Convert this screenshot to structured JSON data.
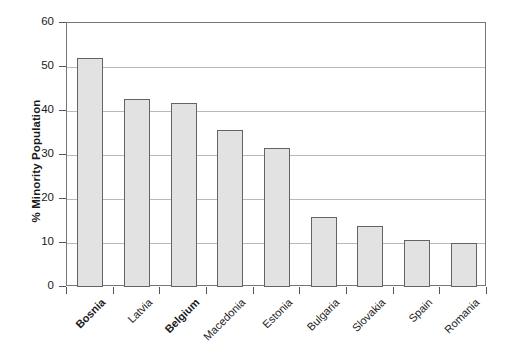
{
  "chart_data": {
    "type": "bar",
    "title": "",
    "xlabel": "",
    "ylabel": "% Minority Population",
    "ylim": [
      0,
      60
    ],
    "ytick_values": [
      0,
      10,
      20,
      30,
      40,
      50,
      60
    ],
    "ytick_labels": [
      "0",
      "10",
      "20",
      "30",
      "40",
      "50",
      "60"
    ],
    "grid": true,
    "legend": "none",
    "bar_color": "#e2e2e2",
    "bar_edge_color": "#636363",
    "categories": [
      "Bosnia",
      "Latvia",
      "Belgium",
      "Macedonia",
      "Estonia",
      "Bulgaria",
      "Slovakia",
      "Spain",
      "Romania"
    ],
    "values": [
      52.0,
      42.8,
      41.8,
      35.7,
      31.7,
      15.8,
      13.8,
      10.7,
      10.1
    ],
    "emphasized_categories": [
      "Bosnia",
      "Belgium"
    ],
    "bars": [
      {
        "label": "Bosnia",
        "value": 52.0,
        "bold": true
      },
      {
        "label": "Latvia",
        "value": 42.8,
        "bold": false
      },
      {
        "label": "Belgium",
        "value": 41.8,
        "bold": true
      },
      {
        "label": "Macedonia",
        "value": 35.7,
        "bold": false
      },
      {
        "label": "Estonia",
        "value": 31.7,
        "bold": false
      },
      {
        "label": "Bulgaria",
        "value": 15.8,
        "bold": false
      },
      {
        "label": "Slovakia",
        "value": 13.8,
        "bold": false
      },
      {
        "label": "Spain",
        "value": 10.7,
        "bold": false
      },
      {
        "label": "Romania",
        "value": 10.1,
        "bold": false
      }
    ]
  }
}
